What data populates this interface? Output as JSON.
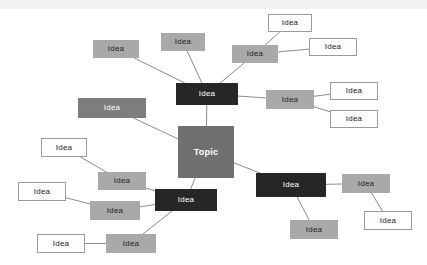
{
  "diagram": {
    "type": "mind-map",
    "title": "Topic",
    "background_color": "#ffffff",
    "styles": {
      "dark": "#262626",
      "midgray": "#7d7d7d",
      "lightgray": "#a9a9a9",
      "white": "#ffffff",
      "topic": "#6f6f6f",
      "edge": "#8c8c8c"
    },
    "nodes": [
      {
        "id": "topic",
        "label": "Topic",
        "style": "topic",
        "x": 178,
        "y": 126,
        "w": 56,
        "h": 52
      },
      {
        "id": "hub_top",
        "label": "Idea",
        "style": "dark",
        "x": 176,
        "y": 83,
        "w": 62,
        "h": 22
      },
      {
        "id": "hub_left",
        "label": "Idea",
        "style": "dark",
        "x": 155,
        "y": 189,
        "w": 62,
        "h": 22
      },
      {
        "id": "hub_right",
        "label": "Idea",
        "style": "dark",
        "x": 256,
        "y": 173,
        "w": 70,
        "h": 24
      },
      {
        "id": "g_topleft",
        "label": "Idea",
        "style": "lightgray",
        "x": 93,
        "y": 40,
        "w": 46,
        "h": 18
      },
      {
        "id": "g_topmid",
        "label": "Idea",
        "style": "lightgray",
        "x": 161,
        "y": 33,
        "w": 44,
        "h": 18
      },
      {
        "id": "g_topright",
        "label": "Idea",
        "style": "lightgray",
        "x": 232,
        "y": 45,
        "w": 46,
        "h": 18
      },
      {
        "id": "g_left_mid",
        "label": "Idea",
        "style": "midgray",
        "x": 78,
        "y": 98,
        "w": 68,
        "h": 20
      },
      {
        "id": "g_right_mid",
        "label": "Idea",
        "style": "lightgray",
        "x": 266,
        "y": 90,
        "w": 48,
        "h": 19
      },
      {
        "id": "w_top_a",
        "label": "Idea",
        "style": "white",
        "x": 268,
        "y": 14,
        "w": 44,
        "h": 18
      },
      {
        "id": "w_top_b",
        "label": "Idea",
        "style": "white",
        "x": 309,
        "y": 38,
        "w": 48,
        "h": 18
      },
      {
        "id": "w_right_a",
        "label": "Idea",
        "style": "white",
        "x": 330,
        "y": 82,
        "w": 48,
        "h": 18
      },
      {
        "id": "w_right_b",
        "label": "Idea",
        "style": "white",
        "x": 330,
        "y": 110,
        "w": 48,
        "h": 18
      },
      {
        "id": "g_bl_a",
        "label": "Idea",
        "style": "lightgray",
        "x": 98,
        "y": 172,
        "w": 48,
        "h": 18
      },
      {
        "id": "g_bl_b",
        "label": "Idea",
        "style": "lightgray",
        "x": 90,
        "y": 201,
        "w": 50,
        "h": 19
      },
      {
        "id": "g_bl_c",
        "label": "Idea",
        "style": "lightgray",
        "x": 106,
        "y": 234,
        "w": 50,
        "h": 19
      },
      {
        "id": "w_left_a",
        "label": "Idea",
        "style": "white",
        "x": 41,
        "y": 138,
        "w": 46,
        "h": 19
      },
      {
        "id": "w_left_b",
        "label": "Idea",
        "style": "white",
        "x": 18,
        "y": 182,
        "w": 48,
        "h": 19
      },
      {
        "id": "w_left_c",
        "label": "Idea",
        "style": "white",
        "x": 37,
        "y": 234,
        "w": 48,
        "h": 19
      },
      {
        "id": "g_br_a",
        "label": "Idea",
        "style": "lightgray",
        "x": 342,
        "y": 174,
        "w": 48,
        "h": 19
      },
      {
        "id": "g_br_b",
        "label": "Idea",
        "style": "lightgray",
        "x": 290,
        "y": 220,
        "w": 48,
        "h": 19
      },
      {
        "id": "w_br_a",
        "label": "Idea",
        "style": "white",
        "x": 364,
        "y": 211,
        "w": 48,
        "h": 19
      }
    ],
    "edges": [
      {
        "from": "topic",
        "to": "hub_top"
      },
      {
        "from": "topic",
        "to": "hub_left"
      },
      {
        "from": "topic",
        "to": "hub_right"
      },
      {
        "from": "topic",
        "to": "g_left_mid"
      },
      {
        "from": "hub_top",
        "to": "g_topleft"
      },
      {
        "from": "hub_top",
        "to": "g_topmid"
      },
      {
        "from": "hub_top",
        "to": "g_topright"
      },
      {
        "from": "hub_top",
        "to": "g_right_mid"
      },
      {
        "from": "g_topright",
        "to": "w_top_a"
      },
      {
        "from": "g_topright",
        "to": "w_top_b"
      },
      {
        "from": "g_right_mid",
        "to": "w_right_a"
      },
      {
        "from": "g_right_mid",
        "to": "w_right_b"
      },
      {
        "from": "hub_left",
        "to": "g_bl_a"
      },
      {
        "from": "hub_left",
        "to": "g_bl_b"
      },
      {
        "from": "hub_left",
        "to": "g_bl_c"
      },
      {
        "from": "g_bl_a",
        "to": "w_left_a"
      },
      {
        "from": "g_bl_b",
        "to": "w_left_b"
      },
      {
        "from": "g_bl_c",
        "to": "w_left_c"
      },
      {
        "from": "hub_right",
        "to": "g_br_a"
      },
      {
        "from": "hub_right",
        "to": "g_br_b"
      },
      {
        "from": "g_br_a",
        "to": "w_br_a"
      }
    ]
  }
}
